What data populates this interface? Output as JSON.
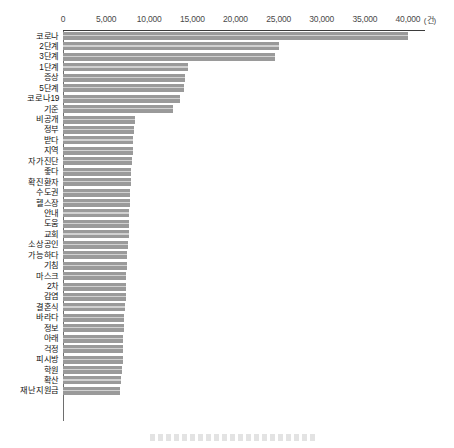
{
  "chart_data": {
    "type": "bar",
    "orientation": "horizontal",
    "title": "",
    "xlabel": "",
    "ylabel": "",
    "unit_label": "(건)",
    "xlim": [
      0,
      41000
    ],
    "grid": false,
    "legend": "none",
    "bar_color": "#9a9a9a",
    "tick_labels": [
      "0",
      "5,000",
      "10,000",
      "15,000",
      "20,000",
      "25,000",
      "30,000",
      "35,000",
      "40,000"
    ],
    "tick_values": [
      0,
      5000,
      10000,
      15000,
      20000,
      25000,
      30000,
      35000,
      40000
    ],
    "categories": [
      "코로나",
      "2단계",
      "3단계",
      "1단계",
      "증상",
      "5단계",
      "코로나19",
      "기준",
      "비공개",
      "정부",
      "받다",
      "지역",
      "자가진단",
      "좋다",
      "확진환자",
      "수도권",
      "헬스장",
      "안내",
      "도움",
      "교회",
      "소상공인",
      "가능하다",
      "기침",
      "마스크",
      "2차",
      "감염",
      "결혼식",
      "바라다",
      "정보",
      "아래",
      "걱정",
      "피시방",
      "학원",
      "확산",
      "재난지원금"
    ],
    "values": [
      40000,
      25100,
      24600,
      14500,
      14100,
      14000,
      13600,
      12700,
      8300,
      8200,
      8150,
      8100,
      8000,
      7900,
      7850,
      7800,
      7750,
      7700,
      7650,
      7600,
      7500,
      7450,
      7400,
      7350,
      7300,
      7250,
      7200,
      7100,
      7050,
      7000,
      6950,
      6900,
      6850,
      6750,
      6600
    ]
  }
}
